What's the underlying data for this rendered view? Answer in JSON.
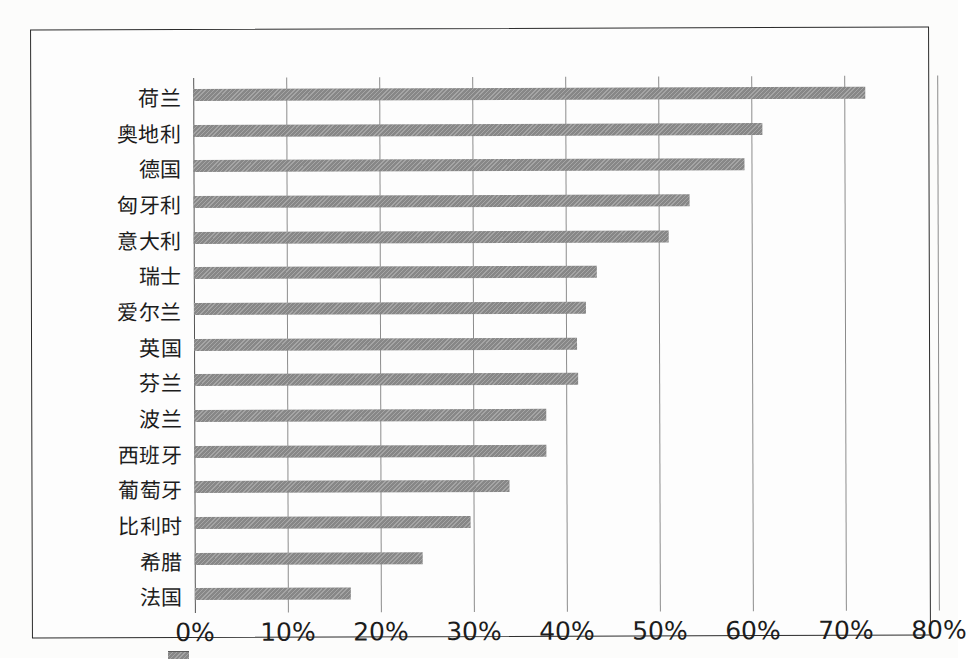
{
  "chart_data": {
    "type": "bar",
    "orientation": "horizontal",
    "title": "",
    "subtitle": "",
    "xlabel": "",
    "ylabel": "",
    "xlim": [
      0,
      80
    ],
    "ylim": null,
    "grid": true,
    "legend_position": "bottom",
    "tick_suffix": "%",
    "categories": [
      "荷兰",
      "奥地利",
      "德国",
      "匈牙利",
      "意大利",
      "瑞士",
      "爱尔兰",
      "英国",
      "芬兰",
      "波兰",
      "西班牙",
      "葡萄牙",
      "比利时",
      "希腊",
      "法国"
    ],
    "values": [
      72.3,
      61.2,
      59.3,
      53.3,
      51.1,
      43.3,
      42.2,
      41.2,
      41.3,
      37.9,
      37.9,
      33.9,
      29.7,
      24.5,
      16.8
    ],
    "xticks": [
      0,
      10,
      20,
      30,
      40,
      50,
      60,
      70,
      80
    ],
    "xtick_labels": [
      "0%",
      "10%",
      "20%",
      "30%",
      "40%",
      "50%",
      "60%",
      "70%",
      "80%"
    ],
    "series": [
      {
        "name": "",
        "color": "#8f8f8f",
        "values": [
          72.3,
          61.2,
          59.3,
          53.3,
          51.1,
          43.3,
          42.2,
          41.2,
          41.3,
          37.9,
          37.9,
          33.9,
          29.7,
          24.5,
          16.8
        ]
      }
    ],
    "colors": {
      "bar": "#8f8f8f",
      "gridline": "#8c8c8c",
      "axis": "#555555",
      "frame": "#2b2b2b",
      "text": "#1c1c1c",
      "background": "#fdfdfd"
    }
  }
}
